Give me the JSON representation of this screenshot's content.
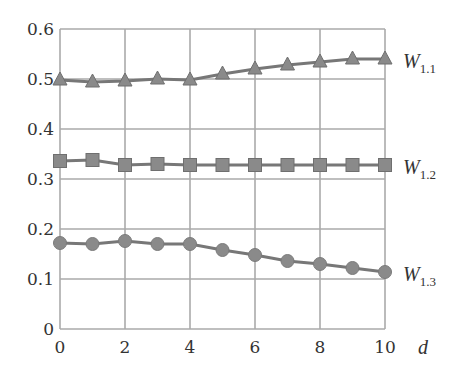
{
  "chart_data": {
    "type": "line",
    "title": "",
    "xlabel": "d",
    "ylabel": "",
    "xlim": [
      0,
      10
    ],
    "ylim": [
      0,
      0.6
    ],
    "grid": true,
    "legend_position": "inline-right",
    "x": [
      0,
      1,
      2,
      3,
      4,
      5,
      6,
      7,
      8,
      9,
      10
    ],
    "x_ticks": [
      "0",
      "2",
      "4",
      "6",
      "8",
      "10"
    ],
    "y_ticks": [
      "0",
      "0.1",
      "0.2",
      "0.3",
      "0.4",
      "0.5",
      "0.6"
    ],
    "series": [
      {
        "name": "W1.1",
        "label_main": "W",
        "label_sub": "1.1",
        "marker": "triangle",
        "values": [
          0.498,
          0.494,
          0.496,
          0.5,
          0.498,
          0.51,
          0.52,
          0.528,
          0.534,
          0.54,
          0.54
        ]
      },
      {
        "name": "W1.2",
        "label_main": "W",
        "label_sub": "1.2",
        "marker": "square",
        "values": [
          0.336,
          0.338,
          0.328,
          0.33,
          0.328,
          0.328,
          0.328,
          0.328,
          0.328,
          0.328,
          0.328
        ]
      },
      {
        "name": "W1.3",
        "label_main": "W",
        "label_sub": "1.3",
        "marker": "circle",
        "values": [
          0.172,
          0.17,
          0.176,
          0.17,
          0.17,
          0.158,
          0.148,
          0.136,
          0.13,
          0.122,
          0.114
        ]
      }
    ]
  },
  "colors": {
    "grid": "#aaaaaa",
    "series": "#777777",
    "marker": "#8a8a8a",
    "text": "#333333"
  }
}
